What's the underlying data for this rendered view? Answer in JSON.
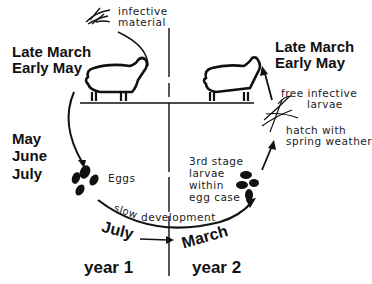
{
  "diagram": {
    "type": "life-cycle",
    "left_season": {
      "line1": "Late March",
      "line2": "Early May"
    },
    "right_season": {
      "line1": "Late March",
      "line2": "Early May"
    },
    "infective_material": {
      "line1": "infective",
      "line2": "material"
    },
    "egg_months": {
      "line1": "May",
      "line2": "June",
      "line3": "July"
    },
    "eggs_label": "Eggs",
    "larvae_within": {
      "line1": "3rd stage",
      "line2": "larvae",
      "line3": "within",
      "line4": "egg case"
    },
    "free_larvae": {
      "line1": "free infective",
      "line2": "larvae"
    },
    "hatch": {
      "line1": "hatch with",
      "line2": "spring weather"
    },
    "slow_dev": {
      "part1": "slow",
      "part2": "development"
    },
    "timeline_start": "July",
    "timeline_end": "March",
    "years": {
      "year1": "year 1",
      "year2": "year 2"
    },
    "colors": {
      "ink": "#111111",
      "background": "#ffffff"
    }
  }
}
